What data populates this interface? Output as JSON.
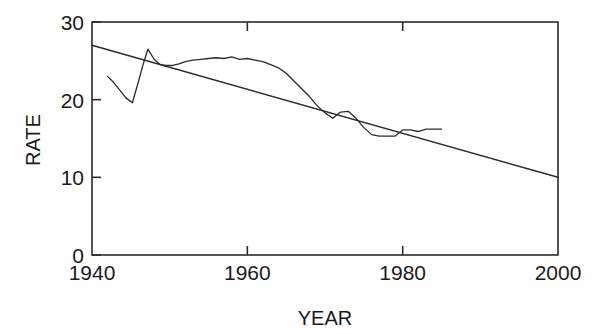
{
  "chart_data": {
    "type": "line",
    "title": "",
    "xlabel": "YEAR",
    "ylabel": "RATE",
    "xlim": [
      1940,
      2000
    ],
    "ylim": [
      0,
      30
    ],
    "xticks": [
      1940,
      1960,
      1980,
      2000
    ],
    "xtick_labels": [
      "1940",
      "1960",
      "1980",
      "2000"
    ],
    "yticks": [
      0,
      10,
      20,
      30
    ],
    "ytick_labels": [
      "0",
      "10",
      "20",
      "30"
    ],
    "grid": false,
    "legend": "none",
    "frame": "box",
    "series": [
      {
        "name": "rate",
        "kind": "line",
        "x": [
          1942.0,
          1942.8,
          1943.6,
          1944.4,
          1945.2,
          1946.0,
          1946.6,
          1947.2,
          1948.0,
          1948.8,
          1949.6,
          1950.4,
          1951.2,
          1952.0,
          1953.0,
          1954.0,
          1955.0,
          1956.0,
          1957.0,
          1958.0,
          1959.0,
          1960.0,
          1961.0,
          1962.0,
          1963.0,
          1964.0,
          1965.0,
          1966.0,
          1967.0,
          1968.0,
          1969.0,
          1970.0,
          1971.0,
          1972.0,
          1973.0,
          1974.0,
          1975.0,
          1976.0,
          1977.0,
          1978.0,
          1979.0,
          1980.0,
          1981.0,
          1982.0,
          1983.0,
          1984.0,
          1985.0
        ],
        "y": [
          23.0,
          22.2,
          21.2,
          20.2,
          19.6,
          22.4,
          24.6,
          26.5,
          25.2,
          24.5,
          24.4,
          24.4,
          24.6,
          24.9,
          25.1,
          25.2,
          25.3,
          25.4,
          25.3,
          25.5,
          25.2,
          25.3,
          25.1,
          24.9,
          24.5,
          24.1,
          23.4,
          22.4,
          21.4,
          20.4,
          19.2,
          18.3,
          17.6,
          18.4,
          18.5,
          17.6,
          16.4,
          15.5,
          15.3,
          15.3,
          15.3,
          16.1,
          16.1,
          15.9,
          16.2,
          16.2,
          16.2
        ]
      },
      {
        "name": "trend",
        "kind": "line",
        "x": [
          1940,
          2000
        ],
        "y": [
          27.0,
          10.0
        ]
      }
    ]
  },
  "colors": {
    "ink": "#2b2b2b",
    "background": "#ffffff"
  }
}
